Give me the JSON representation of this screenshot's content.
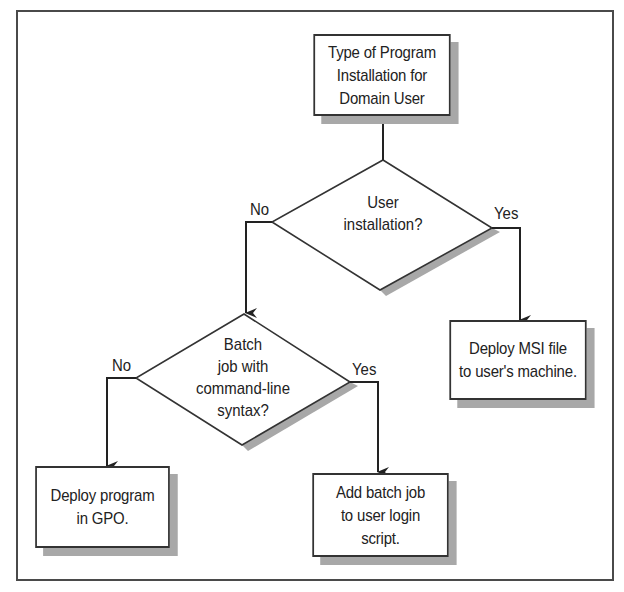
{
  "diagram": {
    "type": "flowchart",
    "title": "Type of Program Installation for Domain User",
    "colors": {
      "line": "#333333",
      "shadow": "#a8a8a8",
      "frame": "#4a4a4a",
      "background": "#ffffff"
    },
    "nodes": {
      "start": {
        "kind": "process",
        "text": "Type of Program\nInstallation for\nDomain User"
      },
      "decision_user": {
        "kind": "decision",
        "text": "User\ninstallation?"
      },
      "decision_batch": {
        "kind": "decision",
        "text": "Batch\njob with\ncommand-line\nsyntax?"
      },
      "deploy_msi": {
        "kind": "process",
        "text": "Deploy MSI file\nto user's machine."
      },
      "deploy_gpo": {
        "kind": "process",
        "text": "Deploy program\nin GPO."
      },
      "add_batch": {
        "kind": "process",
        "text": "Add batch job\nto user login\nscript."
      }
    },
    "edges": [
      {
        "from": "start",
        "to": "decision_user",
        "label": ""
      },
      {
        "from": "decision_user",
        "to": "decision_batch",
        "label": "No"
      },
      {
        "from": "decision_user",
        "to": "deploy_msi",
        "label": "Yes"
      },
      {
        "from": "decision_batch",
        "to": "deploy_gpo",
        "label": "No"
      },
      {
        "from": "decision_batch",
        "to": "add_batch",
        "label": "Yes"
      }
    ]
  }
}
